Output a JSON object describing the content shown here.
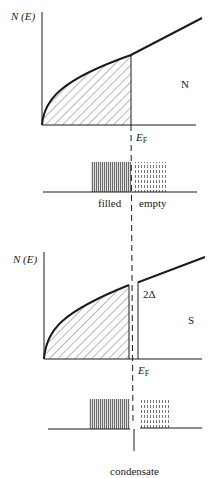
{
  "figure": {
    "top_panel": {
      "name": "normal-metal",
      "y_axis_label": "N (E)",
      "state_label": "N",
      "fermi_label": "E",
      "fermi_subscript": "F",
      "occupation_labels": {
        "filled": "filled",
        "empty": "empty"
      }
    },
    "bottom_panel": {
      "name": "superconductor",
      "y_axis_label": "N (E)",
      "state_label": "S",
      "gap_label": "2Δ",
      "fermi_label": "E",
      "fermi_subscript": "F",
      "caption": "condensate"
    },
    "colors": {
      "ink": "#1a1a1a",
      "filled_block": "#8a8a8a",
      "empty_block": "#9a9a9a"
    }
  }
}
